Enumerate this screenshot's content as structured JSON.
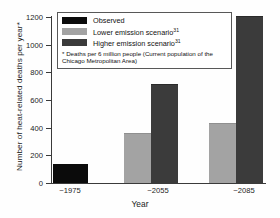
{
  "chart_data": {
    "type": "bar",
    "title": "",
    "xlabel": "Year",
    "ylabel": "Number of heat-related deaths per year*",
    "ylim": [
      0,
      1200
    ],
    "yticks": [
      0,
      200,
      400,
      600,
      800,
      1000,
      1200
    ],
    "ytick_labels": [
      "0",
      "200",
      "400",
      "600",
      "800",
      "1000",
      "1200"
    ],
    "grid": false,
    "legend_position": "upper-left",
    "categories": [
      "~1975",
      "~2055",
      "~2085"
    ],
    "series": [
      {
        "name": "Observed",
        "color": "#0b0b0b",
        "values": [
          137,
          null,
          null
        ]
      },
      {
        "name": "Lower emission scenario",
        "superscript": "31",
        "color": "#a3a3a3",
        "values": [
          null,
          355,
          430
        ]
      },
      {
        "name": "Higher emission scenario",
        "superscript": "31",
        "color": "#3b3b3b",
        "values": [
          null,
          710,
          1200
        ]
      }
    ],
    "annotations": [
      "* Deaths per 6 million people (Current population of the Chicago Metropolitan Area)"
    ]
  },
  "legend": {
    "entries": [
      {
        "label": "Observed",
        "superscript": ""
      },
      {
        "label": "Lower emission scenario",
        "superscript": "31"
      },
      {
        "label": "Higher emission scenario",
        "superscript": "31"
      }
    ],
    "note": "* Deaths per 6 million people (Current population of the Chicago Metropolitan Area)"
  },
  "axes": {
    "y_title": "Number of heat-related deaths per year*",
    "x_title": "Year",
    "y_ticks": [
      "1200",
      "1000",
      "800",
      "600",
      "400",
      "200",
      "0"
    ],
    "x_ticks": [
      "~1975",
      "~2055",
      "~2085"
    ]
  }
}
